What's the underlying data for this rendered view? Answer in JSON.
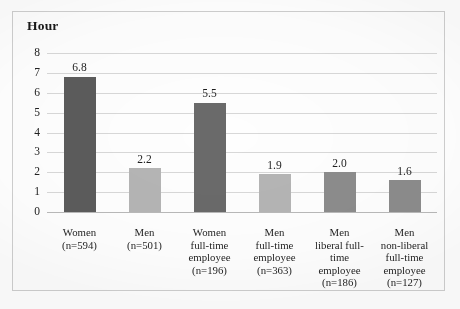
{
  "chart": {
    "title": "Hour",
    "frame_color": "#cfcfcf"
  },
  "chart_data": {
    "type": "bar",
    "title": "Hour",
    "xlabel": "",
    "ylabel": "Hour",
    "ylim": [
      0,
      8
    ],
    "ytick_step": 1,
    "ytick_labels": [
      "8",
      "7",
      "6",
      "5",
      "4",
      "3",
      "2",
      "1",
      "0"
    ],
    "grid": true,
    "legend": "none",
    "categories": [
      "Women (n=594)",
      "Men (n=501)",
      "Women full-time employee (n=196)",
      "Men full-time employee (n=363)",
      "Men liberal full-time employee (n=186)",
      "Men non-liberal full-time employee (n=127)"
    ],
    "values": [
      6.8,
      2.2,
      5.5,
      1.9,
      2.0,
      1.6
    ],
    "value_labels": [
      "6.8",
      "2.2",
      "5.5",
      "1.9",
      "2.0",
      "1.6"
    ],
    "bar_colors": [
      "#5c5c5c",
      "#b5b5b5",
      "#6a6a6a",
      "#b5b5b5",
      "#8c8c8c",
      "#8c8c8c"
    ],
    "sample_sizes": [
      594,
      501,
      196,
      363,
      186,
      127
    ],
    "bars": [
      {
        "value": 6.8,
        "value_label": "6.8",
        "color": "#5c5c5c",
        "label_lines": [
          "Women",
          "(n=594)"
        ]
      },
      {
        "value": 2.2,
        "value_label": "2.2",
        "color": "#b5b5b5",
        "label_lines": [
          "Men",
          "(n=501)"
        ]
      },
      {
        "value": 5.5,
        "value_label": "5.5",
        "color": "#6a6a6a",
        "label_lines": [
          "Women",
          "full-time",
          "employee",
          "(n=196)"
        ]
      },
      {
        "value": 1.9,
        "value_label": "1.9",
        "color": "#b5b5b5",
        "label_lines": [
          "Men",
          "full-time",
          "employee",
          "(n=363)"
        ]
      },
      {
        "value": 2.0,
        "value_label": "2.0",
        "color": "#8c8c8c",
        "label_lines": [
          "Men",
          "liberal full-",
          "time",
          "employee",
          "(n=186)"
        ]
      },
      {
        "value": 1.6,
        "value_label": "1.6",
        "color": "#8c8c8c",
        "label_lines": [
          "Men",
          "non-liberal",
          "full-time",
          "employee",
          "(n=127)"
        ]
      }
    ]
  }
}
